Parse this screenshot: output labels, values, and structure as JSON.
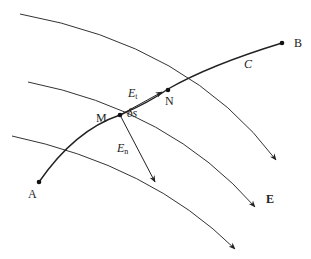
{
  "diagram": {
    "points": {
      "A": "A",
      "B": "B",
      "M": "M",
      "N": "N"
    },
    "labels": {
      "path": "C",
      "field": "E",
      "tangent_main": "E",
      "tangent_sub": "t",
      "normal_main": "E",
      "normal_sub": "n",
      "displacement": "δs"
    },
    "colors": {
      "line": "#333333",
      "background": "#ffffff"
    }
  }
}
